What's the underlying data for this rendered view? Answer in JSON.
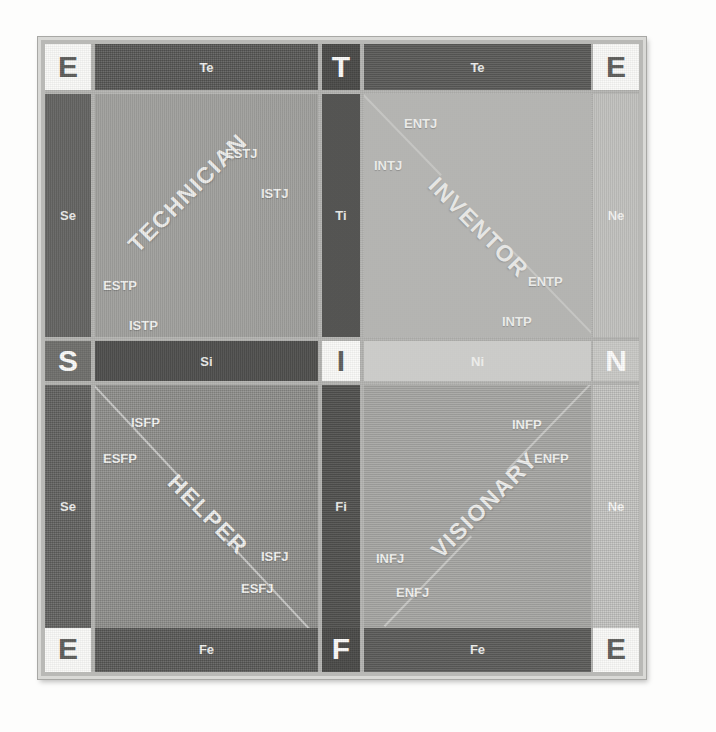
{
  "diagram": {
    "colors": {
      "frame_border": "#d9d9d6",
      "panel_background": "#b4b4b1",
      "corner_box": "#fafaf8",
      "dark_bar": "#585856",
      "light_bar": "#c6c6c3",
      "diagonal_line": "#d2d2cf",
      "label_text": "#fafaf8"
    },
    "corners": [
      {
        "id": "corner-top-left",
        "label": "E",
        "style": "white"
      },
      {
        "id": "corner-top-right",
        "label": "E",
        "style": "white"
      },
      {
        "id": "corner-bottom-left",
        "label": "E",
        "style": "white"
      },
      {
        "id": "corner-bottom-right",
        "label": "E",
        "style": "white"
      }
    ],
    "axis_markers": [
      {
        "id": "axis-top-center",
        "label": "T",
        "style": "dark"
      },
      {
        "id": "axis-bottom-center",
        "label": "F",
        "style": "dark"
      },
      {
        "id": "axis-left-center",
        "label": "S",
        "style": "mid"
      },
      {
        "id": "axis-right-center",
        "label": "N",
        "style": "light"
      },
      {
        "id": "axis-middle-center",
        "label": "I",
        "style": "white"
      }
    ],
    "function_bars": [
      {
        "id": "bar-te-left",
        "label": "Te",
        "orientation": "horizontal",
        "tone": "dark"
      },
      {
        "id": "bar-te-right",
        "label": "Te",
        "orientation": "horizontal",
        "tone": "dark"
      },
      {
        "id": "bar-fe-left",
        "label": "Fe",
        "orientation": "horizontal",
        "tone": "dark"
      },
      {
        "id": "bar-fe-right",
        "label": "Fe",
        "orientation": "horizontal",
        "tone": "dark"
      },
      {
        "id": "bar-si",
        "label": "Si",
        "orientation": "horizontal",
        "tone": "dark"
      },
      {
        "id": "bar-ni",
        "label": "Ni",
        "orientation": "horizontal",
        "tone": "light"
      },
      {
        "id": "bar-se-top",
        "label": "Se",
        "orientation": "vertical",
        "tone": "dark"
      },
      {
        "id": "bar-se-bottom",
        "label": "Se",
        "orientation": "vertical",
        "tone": "dark"
      },
      {
        "id": "bar-ne-top",
        "label": "Ne",
        "orientation": "vertical",
        "tone": "light"
      },
      {
        "id": "bar-ne-bottom",
        "label": "Ne",
        "orientation": "vertical",
        "tone": "light"
      },
      {
        "id": "bar-ti",
        "label": "Ti",
        "orientation": "vertical",
        "tone": "dark"
      },
      {
        "id": "bar-fi",
        "label": "Fi",
        "orientation": "vertical",
        "tone": "dark"
      }
    ],
    "quadrants": [
      {
        "id": "quadrant-technician",
        "title": "TECHNICIAN",
        "position": "top-left",
        "types": [
          "ESTJ",
          "ISTJ",
          "ESTP",
          "ISTP"
        ]
      },
      {
        "id": "quadrant-inventor",
        "title": "INVENTOR",
        "position": "top-right",
        "types": [
          "ENTJ",
          "INTJ",
          "ENTP",
          "INTP"
        ]
      },
      {
        "id": "quadrant-helper",
        "title": "HELPER",
        "position": "bottom-left",
        "types": [
          "ISFP",
          "ESFP",
          "ISFJ",
          "ESFJ"
        ]
      },
      {
        "id": "quadrant-visionary",
        "title": "VISIONARY",
        "position": "bottom-right",
        "types": [
          "INFP",
          "ENFP",
          "INFJ",
          "ENFJ"
        ]
      }
    ],
    "labels": {
      "technician": {
        "title": "TECHNICIAN",
        "estj": "ESTJ",
        "istj": "ISTJ",
        "estp": "ESTP",
        "istp": "ISTP"
      },
      "inventor": {
        "title": "INVENTOR",
        "entj": "ENTJ",
        "intj": "INTJ",
        "entp": "ENTP",
        "intp": "INTP"
      },
      "helper": {
        "title": "HELPER",
        "isfp": "ISFP",
        "esfp": "ESFP",
        "isfj": "ISFJ",
        "esfj": "ESFJ"
      },
      "visionary": {
        "title": "VISIONARY",
        "infp": "INFP",
        "enfp": "ENFP",
        "infj": "INFJ",
        "enfj": "ENFJ"
      }
    },
    "bars": {
      "te_left": "Te",
      "te_right": "Te",
      "fe_left": "Fe",
      "fe_right": "Fe",
      "si": "Si",
      "ni": "Ni",
      "se_top": "Se",
      "se_bottom": "Se",
      "ne_top": "Ne",
      "ne_bottom": "Ne",
      "ti": "Ti",
      "fi": "Fi"
    },
    "markers": {
      "e_top_left": "E",
      "e_top_right": "E",
      "e_bottom_left": "E",
      "e_bottom_right": "E",
      "t_top": "T",
      "f_bottom": "F",
      "s_left": "S",
      "n_right": "N",
      "i_center": "I"
    }
  }
}
